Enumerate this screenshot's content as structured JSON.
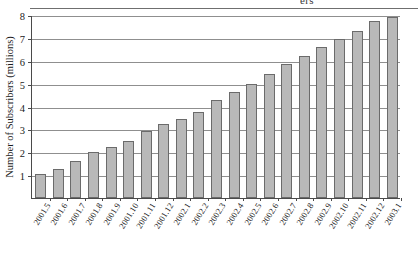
{
  "figure": {
    "top_partial_text": "ers",
    "ylabel": "Number of Subscribers (millions)",
    "bar_fill_color": "#b9b9b9",
    "bar_border_color": "#6b6b6b",
    "axis_color": "#4a4a4a",
    "grid_color": "#8f8f8f",
    "background_color": "#ffffff"
  },
  "chart_data": {
    "type": "bar",
    "title": "",
    "subtitle": "",
    "xlabel": "",
    "ylabel": "Number of Subscribers (millions)",
    "ylim": [
      0,
      8
    ],
    "xlim_note": "21 monthly categories",
    "yticks": [
      1,
      2,
      3,
      4,
      5,
      6,
      7,
      8
    ],
    "ytick_labels": [
      "1",
      "2",
      "3",
      "4",
      "5",
      "6",
      "7",
      "8"
    ],
    "grid": true,
    "grid_axis": "y",
    "legend": false,
    "legend_position": "none",
    "categories": [
      "2001.5",
      "2001.6",
      "2001.7",
      "2001.8",
      "2001.9",
      "2001.10",
      "2001.11",
      "2001.12",
      "2002.1",
      "2002.2",
      "2002.3",
      "2002.4",
      "2002.5",
      "2002.6",
      "2002.7",
      "2002.8",
      "2002.9",
      "2002.10",
      "2002.11",
      "2002.12",
      "2003.1"
    ],
    "values": [
      1.05,
      1.25,
      1.6,
      2.0,
      2.25,
      2.5,
      2.95,
      3.25,
      3.45,
      3.75,
      4.3,
      4.65,
      5.0,
      5.4,
      5.85,
      6.2,
      6.6,
      6.95,
      7.3,
      7.75,
      7.9
    ],
    "value_unit": "millions of subscribers",
    "annotations": []
  }
}
